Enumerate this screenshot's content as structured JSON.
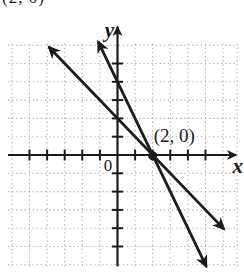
{
  "figure": {
    "ink": "#1b1b1b",
    "grid_color": "#ababab",
    "background": "#ffffff"
  },
  "clipped_label": {
    "text": "(2, 0)"
  },
  "chart_data": {
    "type": "line",
    "title": "",
    "xlabel": "x",
    "ylabel": "y",
    "origin_label": "0",
    "xlim": [
      -6.2,
      7.0
    ],
    "ylim": [
      -6.5,
      7.3
    ],
    "grid": "dotted",
    "tick_step": 1,
    "x_ticks": [
      -5,
      -4,
      -3,
      -2,
      -1,
      1,
      2,
      3,
      4,
      5
    ],
    "y_ticks": [
      -5,
      -4,
      -3,
      -2,
      -1,
      1,
      2,
      3,
      4,
      5
    ],
    "series": [
      {
        "name": "line-slope-minus-1",
        "equation": "y = -x + 2",
        "slope": -1,
        "y_intercept": 2,
        "x_span": [
          -3.9,
          6.05
        ]
      },
      {
        "name": "line-slope-minus-2",
        "equation": "y = -2x + 4",
        "slope": -2,
        "y_intercept": 4,
        "x_span": [
          -1.1,
          5.05
        ]
      }
    ],
    "intersection_point": {
      "x": 2,
      "y": 0,
      "label": "(2, 0)"
    },
    "legend": "none"
  }
}
